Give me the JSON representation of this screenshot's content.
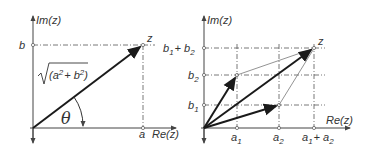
{
  "left_panel": {
    "y_axis_label": "Im(z)",
    "x_axis_label": "Re(z)",
    "point_label": "z",
    "b_label": "b",
    "a_label": "a",
    "magnitude_label": "√(a² + b²)",
    "magnitude_radicand": "(a",
    "magnitude_mid": "+ b",
    "magnitude_end": ")",
    "sup": "2",
    "angle_label": "θ"
  },
  "right_panel": {
    "y_axis_label": "Im(z)",
    "x_axis_label": "Re(z)",
    "point_label": "z",
    "y_ticks": [
      {
        "main": "b",
        "sub": "1"
      },
      {
        "main": "b",
        "sub": "2"
      },
      {
        "main": "b",
        "sub1": "1",
        "plus": "+ b",
        "sub2": "2"
      }
    ],
    "x_ticks": [
      {
        "main": "a",
        "sub": "1"
      },
      {
        "main": "a",
        "sub": "2"
      },
      {
        "main": "a",
        "sub1": "1",
        "plus": "+ a",
        "sub2": "2"
      }
    ]
  },
  "colors": {
    "axis": "#444444",
    "vector": "#1a1a1a",
    "guide": "#555555",
    "thin": "#777777"
  }
}
